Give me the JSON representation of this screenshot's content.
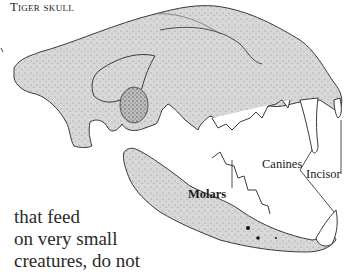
{
  "figure": {
    "title": "Tiger skull",
    "labels": {
      "canines": "Canines",
      "incisor": "Incisor",
      "molars": "Molars"
    },
    "colors": {
      "bone_fill": "#d6d6d6",
      "outline": "#3a3a3a",
      "background": "#ffffff"
    }
  },
  "body_text": {
    "lines": [
      "that feed",
      "on very small",
      "creatures, do not"
    ]
  }
}
